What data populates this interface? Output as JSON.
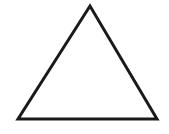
{
  "diagram": {
    "shape": "triangle",
    "fill": "#ffffff",
    "stroke": "#1a1a1a",
    "stroke_width": 3,
    "vertices": [
      {
        "x": 90,
        "y": 6
      },
      {
        "x": 18,
        "y": 119
      },
      {
        "x": 157,
        "y": 119
      }
    ]
  },
  "background": "#ffffff"
}
